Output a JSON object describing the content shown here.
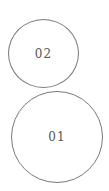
{
  "nodes": [
    {
      "label": "02"
    },
    {
      "label": "01"
    }
  ]
}
